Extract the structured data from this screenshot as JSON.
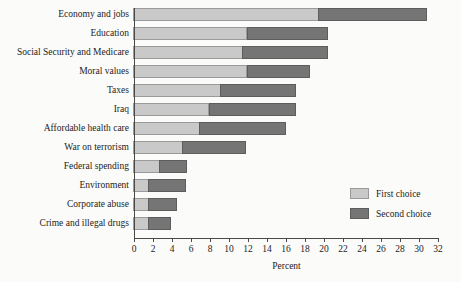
{
  "chart_data": {
    "type": "bar",
    "orientation": "horizontal",
    "stacked": true,
    "title": "",
    "xlabel": "Percent",
    "ylabel": "",
    "xlim": [
      0,
      32
    ],
    "xticks": [
      0,
      2,
      4,
      6,
      8,
      10,
      12,
      14,
      16,
      18,
      20,
      22,
      24,
      26,
      28,
      30,
      32
    ],
    "grid": false,
    "legend_position": "inside-right",
    "categories": [
      "Economy and jobs",
      "Education",
      "Social Security and Medicare",
      "Moral values",
      "Taxes",
      "Iraq",
      "Affordable health care",
      "War on terrorism",
      "Federal spending",
      "Environment",
      "Corporate abuse",
      "Crime and illegal drugs"
    ],
    "series": [
      {
        "name": "First choice",
        "color": "#c9c9c9",
        "values": [
          19.5,
          12.0,
          11.5,
          12.0,
          9.2,
          8.0,
          7.0,
          5.2,
          2.8,
          1.6,
          1.6,
          1.6
        ]
      },
      {
        "name": "Second choice",
        "color": "#757575",
        "values": [
          11.5,
          8.5,
          9.0,
          6.7,
          8.0,
          9.2,
          9.1,
          6.7,
          2.9,
          4.0,
          3.1,
          2.4
        ]
      }
    ],
    "totals": [
      31.0,
      20.5,
      20.5,
      18.7,
      17.2,
      17.2,
      16.1,
      11.9,
      5.7,
      5.6,
      4.7,
      4.0
    ]
  },
  "legend": {
    "items": [
      {
        "label": "First choice",
        "swatch": "first"
      },
      {
        "label": "Second choice",
        "swatch": "second"
      }
    ]
  }
}
